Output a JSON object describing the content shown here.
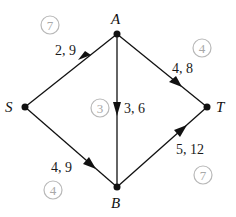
{
  "diagram": {
    "type": "directed-network",
    "colors": {
      "edge": "#111111",
      "node": "#111111",
      "label": "#1a1a1a",
      "badge_stroke": "#b8b8b8",
      "badge_text": "#a8a8a8",
      "background": "#ffffff"
    },
    "nodes": [
      {
        "id": "S",
        "label": "S",
        "x": 25,
        "y": 107
      },
      {
        "id": "A",
        "label": "A",
        "x": 117,
        "y": 34
      },
      {
        "id": "B",
        "label": "B",
        "x": 117,
        "y": 187
      },
      {
        "id": "T",
        "label": "T",
        "x": 207,
        "y": 107
      }
    ],
    "edges": [
      {
        "from": "S",
        "to": "A",
        "label": "2, 9",
        "badge": "7"
      },
      {
        "from": "A",
        "to": "T",
        "label": "4, 8",
        "badge": "4"
      },
      {
        "from": "A",
        "to": "B",
        "label": "3, 6",
        "badge": "3"
      },
      {
        "from": "S",
        "to": "B",
        "label": "4, 9",
        "badge": "4"
      },
      {
        "from": "B",
        "to": "T",
        "label": "5, 12",
        "badge": "7"
      }
    ]
  }
}
